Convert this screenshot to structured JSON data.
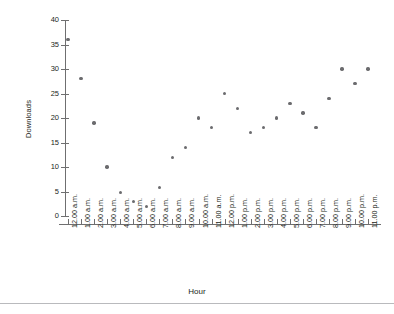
{
  "chart_data": {
    "type": "scatter",
    "title": "",
    "xlabel": "Hour",
    "ylabel": "Downloads",
    "ylim": [
      0,
      40
    ],
    "yticks": [
      0,
      5,
      10,
      15,
      20,
      25,
      30,
      35,
      40
    ],
    "grid": false,
    "legend": null,
    "marker_color": "#6b6b6e",
    "axis_color": "#6f6f70",
    "categories": [
      "12.00 a.m.",
      "1.00 a.m.",
      "2.00 a.m.",
      "3.00 a.m.",
      "4.00 a.m.",
      "5.00 a.m.",
      "6.00 a.m.",
      "7.00 a.m.",
      "8.00 a.m.",
      "9.00 a.m.",
      "10.00 a.m.",
      "11.00 a.m.",
      "12.00 p.m.",
      "1.00 p.m.",
      "2.00 p.m.",
      "3.00 p.m.",
      "4.00 p.m.",
      "5.00 p.m.",
      "6.00 p.m.",
      "7.00 p.m.",
      "8.00 p.m.",
      "9.00 p.m.",
      "10.00 p.m.",
      "11.00 p.m."
    ],
    "values": [
      36,
      28,
      19,
      10,
      4.8,
      3,
      2,
      5.8,
      12,
      14,
      20,
      18,
      25,
      22,
      17,
      18,
      20,
      23,
      21,
      18,
      24,
      30,
      27,
      30
    ]
  }
}
